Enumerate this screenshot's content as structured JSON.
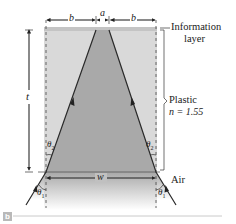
{
  "figure": {
    "panel_label": "b",
    "dimension_labels": {
      "b_left": "b",
      "a": "a",
      "b_right": "b",
      "t": "t",
      "w": "w"
    },
    "layer_labels": {
      "information_layer_line1": "Information",
      "information_layer_line2": "layer",
      "plastic_line1": "Plastic",
      "plastic_line2": "n = 1.55",
      "air": "Air"
    },
    "angle_labels": {
      "theta2_left": "θ",
      "theta2_left_sub": "2",
      "theta2_right": "θ",
      "theta2_right_sub": "2",
      "theta1_left": "θ",
      "theta1_left_sub": "1",
      "theta1_right": "θ",
      "theta1_right_sub": "1"
    },
    "colors": {
      "plastic": "#d9d9d9",
      "information_layer": "#c4c4c4",
      "beam_cone": "#a9a9a9",
      "ray": "#2a2a2a",
      "air_gradient_top": "#a8a8a8",
      "air_gradient_bottom": "#ffffff"
    }
  }
}
